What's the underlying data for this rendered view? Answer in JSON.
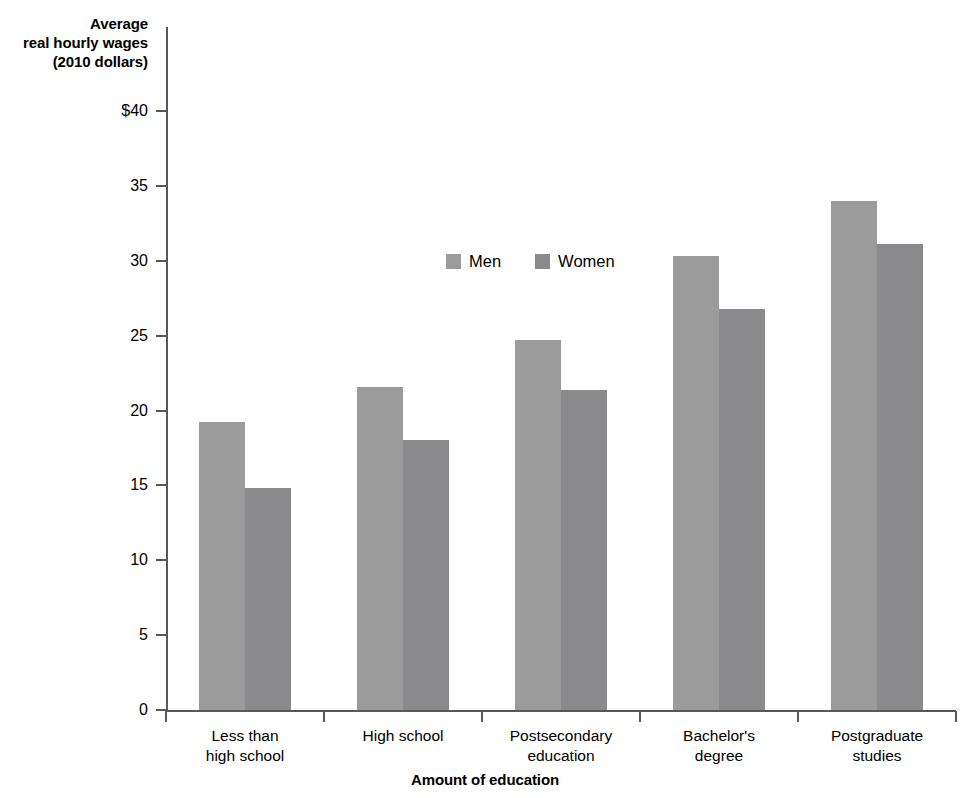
{
  "chart_data": {
    "type": "bar",
    "title": "",
    "ylabel": "Average real hourly wages (2010 dollars)",
    "ylabel_lines": [
      "Average",
      "real hourly wages",
      "(2010 dollars)"
    ],
    "xlabel": "Amount of education",
    "categories": [
      "Less than high school",
      "High school",
      "Postsecondary education",
      "Bachelor's degree",
      "Postgraduate studies"
    ],
    "category_lines": [
      [
        "Less than",
        "high school"
      ],
      [
        "High school",
        ""
      ],
      [
        "Postsecondary",
        "education"
      ],
      [
        "Bachelor's",
        "degree"
      ],
      [
        "Postgraduate",
        "studies"
      ]
    ],
    "series": [
      {
        "name": "Men",
        "color": "#9b9b9b",
        "values": [
          19.2,
          21.6,
          24.7,
          30.3,
          34.0
        ]
      },
      {
        "name": "Women",
        "color": "#8a8a8c",
        "values": [
          14.8,
          18.0,
          21.4,
          26.8,
          31.1
        ]
      }
    ],
    "ylim": [
      0,
      40
    ],
    "ytick_values": [
      0,
      5,
      10,
      15,
      20,
      25,
      30,
      35,
      40
    ],
    "ytick_labels": [
      "0",
      "5",
      "10",
      "15",
      "20",
      "25",
      "30",
      "35",
      "$40"
    ],
    "grid": false,
    "legend_position": "inside-top-center",
    "legend_entries": [
      "Men",
      "Women"
    ]
  }
}
